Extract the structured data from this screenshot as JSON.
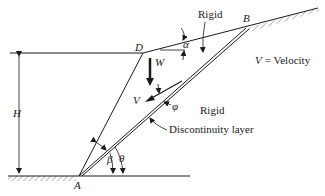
{
  "diagram": {
    "type": "slope-stability-failure-mechanism",
    "points": {
      "A": "A",
      "B": "B",
      "D": "D"
    },
    "labels": {
      "rigid_top": "Rigid",
      "rigid_bottom": "Rigid",
      "velocity_legend": "V = Velocity",
      "velocity_legend_symbol": "V",
      "velocity_legend_text": "= Velocity",
      "discontinuity": "Discontinuity layer",
      "height": "H",
      "weight": "W",
      "velocity": "V",
      "alpha": "α",
      "beta": "β",
      "theta": "θ",
      "phi": "φ"
    },
    "colors": {
      "ink": "#1a1a1a",
      "background": "#ffffff"
    }
  }
}
